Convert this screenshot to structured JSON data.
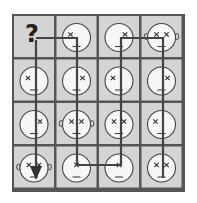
{
  "puzzle": {
    "question_mark": "?",
    "colors": {
      "cell_fill": "#d4d4d4",
      "border": "#555555",
      "face_fill": "#f7f7f7",
      "line": "#444444",
      "background": "#ffffff"
    },
    "grid": {
      "rows": 4,
      "cols": 4
    },
    "cells": [
      [
        {
          "type": "question"
        },
        {
          "face": true,
          "eyes": "left",
          "ears": false
        },
        {
          "face": true,
          "eyes": "right",
          "ears": false
        },
        {
          "face": true,
          "eyes": "both",
          "ears": true
        }
      ],
      [
        {
          "face": true,
          "eyes": "left",
          "ears": false
        },
        {
          "face": true,
          "eyes": "right",
          "ears": false
        },
        {
          "face": true,
          "eyes": "left",
          "ears": false
        },
        {
          "face": true,
          "eyes": "right",
          "ears": false
        }
      ],
      [
        {
          "face": true,
          "eyes": "right",
          "ears": false
        },
        {
          "face": true,
          "eyes": "both",
          "ears": true
        },
        {
          "face": true,
          "eyes": "both",
          "ears": false
        },
        {
          "face": true,
          "eyes": "left",
          "ears": false
        }
      ],
      [
        {
          "face": true,
          "eyes": "both",
          "ears": true
        },
        {
          "face": true,
          "eyes": "center",
          "ears": false
        },
        {
          "face": true,
          "eyes": "center",
          "ears": false
        },
        {
          "face": true,
          "eyes": "both",
          "ears": false
        }
      ]
    ],
    "path_description": "Path starts at the question mark, goes right to column 2, down to row 4, right to column 3, up to row 1, right to column 4, down to row 4; separate arrow from question mark points down to bottom-left cell"
  }
}
